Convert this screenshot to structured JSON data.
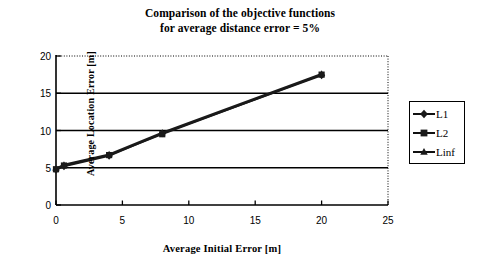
{
  "chart_data": {
    "type": "line",
    "title": "Comparison of the objective functions for average distance error = 5%",
    "title_line1": "Comparison of the objective functions",
    "title_line2": "for average distance error = 5%",
    "xlabel": "Average Initial Error [m]",
    "ylabel": "Average Location Error [m]",
    "xlim": [
      0,
      25
    ],
    "ylim": [
      0,
      20
    ],
    "xticks": [
      0,
      5,
      10,
      15,
      20,
      25
    ],
    "yticks": [
      0,
      5,
      10,
      15,
      20
    ],
    "xtick_labels": [
      "0",
      "5",
      "10",
      "15",
      "20",
      "25"
    ],
    "ytick_labels": [
      "0",
      "5",
      "10",
      "15",
      "20"
    ],
    "grid": "horizontal",
    "legend_position": "right",
    "series": [
      {
        "name": "L1",
        "marker": "diamond",
        "color": "#1a1a1a",
        "x": [
          0,
          0.6,
          4,
          8,
          20
        ],
        "y": [
          4.7,
          5.2,
          6.6,
          9.6,
          17.4
        ]
      },
      {
        "name": "L2",
        "marker": "square",
        "color": "#1a1a1a",
        "x": [
          0,
          0.6,
          4,
          8,
          20
        ],
        "y": [
          4.8,
          5.3,
          6.7,
          9.5,
          17.5
        ]
      },
      {
        "name": "Linf",
        "marker": "triangle",
        "color": "#1a1a1a",
        "x": [
          0,
          0.6,
          4,
          8,
          20
        ],
        "y": [
          4.9,
          5.4,
          6.8,
          9.7,
          17.6
        ]
      }
    ]
  },
  "legend": {
    "items": [
      {
        "label": "L1",
        "marker": "diamond"
      },
      {
        "label": "L2",
        "marker": "square"
      },
      {
        "label": "Linf",
        "marker": "triangle"
      }
    ]
  },
  "colors": {
    "line": "#1a1a1a",
    "axis": "#000000",
    "grid": "#000000",
    "background": "#ffffff"
  }
}
